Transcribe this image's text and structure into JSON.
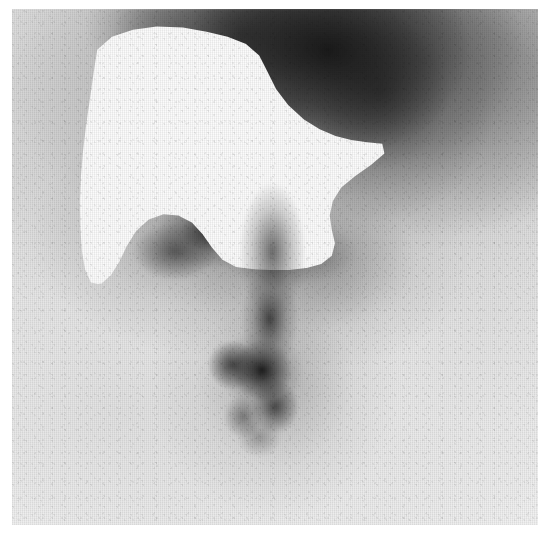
{
  "image": {
    "kind": "nuclear-medicine-scintigram",
    "modality_label": "Scintigram",
    "width": 550,
    "height": 535,
    "orientation": "anterior",
    "color_mode": "grayscale",
    "caption": "",
    "visible_text": ""
  },
  "film": {
    "left": 12,
    "top": 9,
    "width": 526,
    "height": 516,
    "border_color": "#ffffff",
    "background_color": "#eaeaea"
  },
  "palette": {
    "paper_white": "#ffffff",
    "cold_defect_white": "#fbfbfb",
    "light_background_gray": "#eaeaea",
    "mid_gray": "#b4b4b4",
    "dark_uptake_gray": "#4a4a4a",
    "darkest_uptake": "#1a1a1a"
  },
  "regions": [
    {
      "name": "cold-defect",
      "label": "Photopenic cold defect",
      "tone": "white",
      "intensity": "absent uptake",
      "approx_center_pct": {
        "x": 40,
        "y": 27
      },
      "approx_bbox_pct": {
        "x": 12.9,
        "y": 3.4,
        "w": 57.9,
        "h": 50.0
      }
    },
    {
      "name": "superior-dark-uptake-band",
      "label": "Superior dense uptake band",
      "tone": "dark",
      "intensity": "high uptake",
      "approx_center_pct": {
        "x": 60,
        "y": 8
      },
      "approx_bbox_pct": {
        "x": 28,
        "y": 0,
        "w": 58,
        "h": 26
      }
    },
    {
      "name": "central-dark-notch",
      "label": "Central dark notch below defect",
      "tone": "dark",
      "intensity": "moderate-high uptake",
      "approx_center_pct": {
        "x": 37,
        "y": 44
      },
      "approx_bbox_pct": {
        "x": 24,
        "y": 37,
        "w": 32,
        "h": 16
      }
    },
    {
      "name": "central-focal-hot-spot",
      "label": "Central vertical focal hot spot",
      "tone": "darkest",
      "intensity": "intense focal uptake",
      "approx_center_pct": {
        "x": 48,
        "y": 70
      },
      "approx_bbox_pct": {
        "x": 37,
        "y": 44,
        "w": 24,
        "h": 42
      }
    },
    {
      "name": "peripheral-soft-tissue-haze",
      "label": "Peripheral faint soft-tissue background",
      "tone": "light",
      "intensity": "low background",
      "approx_center_pct": {
        "x": 80,
        "y": 60
      },
      "approx_bbox_pct": {
        "x": 60,
        "y": 25,
        "w": 40,
        "h": 70
      }
    }
  ],
  "texture": {
    "grain": "film raster",
    "raster_lines": "vertical-dominant",
    "noise_level": "moderate"
  }
}
